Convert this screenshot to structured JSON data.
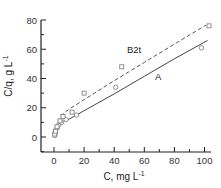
{
  "chart_data": {
    "type": "scatter",
    "title": "",
    "xlabel": "C, mg L",
    "xlabel_sup": "-1",
    "ylabel": "C/q, g L",
    "ylabel_sup": "-1",
    "xlim": [
      -8,
      105
    ],
    "ylim": [
      -10,
      80
    ],
    "xticks": [
      0,
      20,
      40,
      60,
      80,
      100
    ],
    "yticks": [
      0,
      20,
      40,
      60,
      80
    ],
    "grid": false,
    "legend": "none",
    "series": [
      {
        "name": "A",
        "marker": "circle",
        "line": "solid",
        "points": [
          [
            0.5,
            1
          ],
          [
            1,
            3
          ],
          [
            2,
            6
          ],
          [
            3,
            8
          ],
          [
            5,
            10
          ],
          [
            8,
            12
          ],
          [
            15,
            15
          ],
          [
            41,
            34
          ],
          [
            98,
            61
          ]
        ],
        "fit": [
          [
            0.5,
            0
          ],
          [
            1,
            2.5
          ],
          [
            2,
            5.5
          ],
          [
            4,
            8.5
          ],
          [
            7,
            11
          ],
          [
            10,
            12.2
          ],
          [
            20,
            18
          ],
          [
            40,
            29.5
          ],
          [
            60,
            41.5
          ],
          [
            80,
            53.5
          ],
          [
            102,
            66
          ]
        ]
      },
      {
        "name": "B2t",
        "marker": "square",
        "line": "dashed",
        "points": [
          [
            0.5,
            2
          ],
          [
            1,
            4
          ],
          [
            2,
            7
          ],
          [
            4,
            11
          ],
          [
            6,
            14
          ],
          [
            12,
            17
          ],
          [
            20,
            30
          ],
          [
            45,
            48
          ],
          [
            103,
            76
          ]
        ],
        "fit": [
          [
            0.5,
            1.5
          ],
          [
            1,
            4
          ],
          [
            2,
            8
          ],
          [
            3,
            11
          ],
          [
            5,
            15
          ],
          [
            10,
            19
          ],
          [
            20,
            25.5
          ],
          [
            40,
            38.5
          ],
          [
            60,
            51
          ],
          [
            80,
            63.5
          ],
          [
            101,
            76.5
          ]
        ]
      }
    ],
    "annotations": [
      {
        "text": "B2t",
        "x": 49,
        "y": 59
      },
      {
        "text": "A",
        "x": 69,
        "y": 41
      }
    ]
  },
  "labels": {
    "x_ticks": [
      "0",
      "20",
      "40",
      "60",
      "80",
      "100"
    ],
    "y_ticks": [
      "0",
      "20",
      "40",
      "60",
      "80"
    ],
    "x_title": "C, mg L",
    "x_title_sup": "-1",
    "y_title": "C/q, g L",
    "y_title_sup": "-1",
    "series_a": "A",
    "series_b": "B2t"
  }
}
